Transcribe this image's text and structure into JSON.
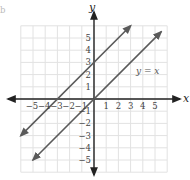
{
  "figure": {
    "axis_labels": {
      "x": "x",
      "y": "y"
    },
    "x_ticks": [
      "−5",
      "−4",
      "−3",
      "−2",
      "−1",
      "1",
      "2",
      "3",
      "4",
      "5"
    ],
    "y_ticks": [
      "5",
      "4",
      "3",
      "2",
      "1",
      "−1",
      "−2",
      "−3",
      "−4",
      "−5"
    ],
    "line_label": "y = x",
    "corner_mark": "b",
    "colors": {
      "grid": "#e2e2e2",
      "axis": "#222222",
      "line": "#5a5a5a",
      "tick": "#444444"
    }
  },
  "chart_data": {
    "type": "line",
    "title": "",
    "xlabel": "x",
    "ylabel": "y",
    "xlim": [
      -6,
      6
    ],
    "ylim": [
      -6,
      6
    ],
    "grid": true,
    "series": [
      {
        "name": "y = x + 3",
        "x": [
          -6,
          3
        ],
        "y": [
          -3,
          6
        ]
      },
      {
        "name": "y = x",
        "x": [
          -5,
          5.5
        ],
        "y": [
          -5,
          5.5
        ]
      }
    ],
    "annotations": [
      {
        "text": "y = x",
        "x": 3.7,
        "y": 2.2
      }
    ]
  }
}
